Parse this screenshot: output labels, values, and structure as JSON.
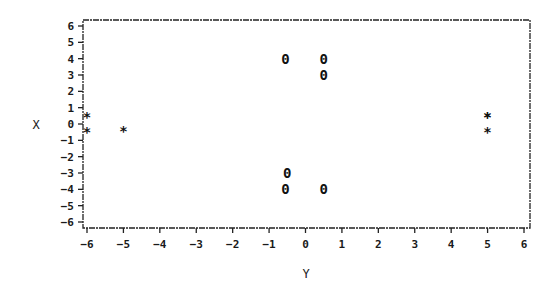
{
  "chart_data": {
    "type": "scatter",
    "title": "",
    "xlabel": "Y",
    "ylabel": "X",
    "xlim": [
      -6,
      6
    ],
    "ylim": [
      -6,
      6
    ],
    "x_ticks": [
      -6,
      -5,
      -4,
      -3,
      -2,
      -1,
      0,
      1,
      2,
      3,
      4,
      5,
      6
    ],
    "y_ticks": [
      6,
      5,
      4,
      3,
      2,
      1,
      0,
      -1,
      -2,
      -3,
      -4,
      -5,
      -6
    ],
    "x_tick_labels": [
      "-6",
      "-5",
      "-4",
      "-3",
      "-2",
      "-1",
      "0",
      "1",
      "2",
      "3",
      "4",
      "5",
      "6"
    ],
    "y_tick_labels": [
      "6",
      "5",
      "4",
      "3",
      "2",
      "1",
      "0",
      "-1",
      "-2",
      "-3",
      "-4",
      "-5",
      "-6"
    ],
    "grid": false,
    "legend": null,
    "series": [
      {
        "name": "*",
        "marker": "*",
        "points": [
          {
            "x": -6,
            "y": 0.4
          },
          {
            "x": -6,
            "y": -0.5
          },
          {
            "x": -5,
            "y": -0.4
          },
          {
            "x": 5,
            "y": 0.4
          },
          {
            "x": 5,
            "y": 0.4
          },
          {
            "x": 5,
            "y": -0.5
          }
        ]
      },
      {
        "name": "0",
        "marker": "0",
        "points": [
          {
            "x": -0.55,
            "y": 4
          },
          {
            "x": 0.5,
            "y": 4
          },
          {
            "x": 0.5,
            "y": 3
          },
          {
            "x": -0.5,
            "y": -3
          },
          {
            "x": -0.55,
            "y": -4
          },
          {
            "x": 0.5,
            "y": -4
          }
        ]
      }
    ]
  }
}
